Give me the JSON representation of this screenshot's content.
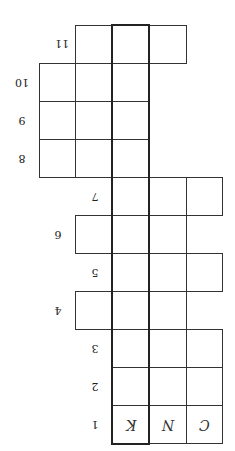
{
  "puzzle": {
    "orientation": "rotated-180",
    "row_labels": [
      "1",
      "2",
      "3",
      "4",
      "5",
      "6",
      "7",
      "8",
      "9",
      "10",
      "11"
    ],
    "filled_letters": {
      "row1_col_highlight": "K",
      "row1_col2": "N",
      "row1_col3": "C"
    }
  }
}
